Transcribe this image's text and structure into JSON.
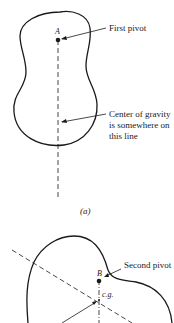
{
  "figure_a": {
    "point_label": "A",
    "pivot_label": "First pivot",
    "cg_line_label": [
      "Center of gravity",
      "is somewhere on",
      "this line"
    ],
    "caption": "(a)"
  },
  "figure_b": {
    "point_label": "B",
    "pivot_label": "Second pivot",
    "cg_label": "c.g."
  },
  "colors": {
    "ink": "#1a1a1a",
    "background": "#ffffff"
  }
}
